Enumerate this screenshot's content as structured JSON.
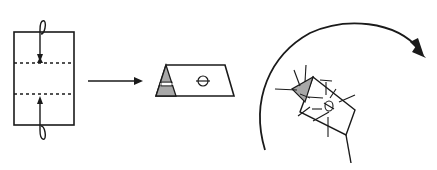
{
  "diagram": {
    "type": "folding-instructions",
    "steps": [
      {
        "id": "step-1",
        "description": "Rectangle with two horizontal dashed fold lines; curved arrows fold top and bottom edges to the lines",
        "fold_lines": 2,
        "arrows": [
          "fold-top-down",
          "fold-bottom-up"
        ]
      },
      {
        "id": "transition",
        "description": "Right-pointing arrow"
      },
      {
        "id": "step-2",
        "description": "Folded parallelogram with shaded triangular end and a small circular mark"
      },
      {
        "id": "step-3",
        "description": "Rotated folded shape with radiating motion lines, enclosed by a large clockwise curved arrow"
      }
    ],
    "colors": {
      "stroke": "#1a1a1a",
      "shade": "#a8a8a8",
      "background": "#ffffff"
    }
  }
}
